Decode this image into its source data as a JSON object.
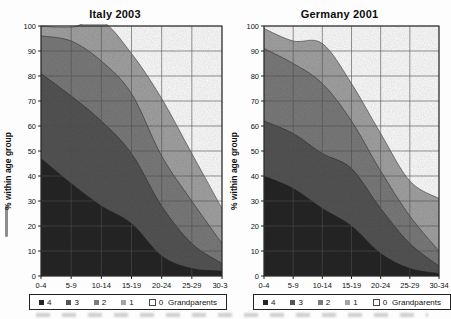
{
  "figure": {
    "y_axis_title": "% within age group",
    "y_ticks": [
      "100",
      "90",
      "80",
      "70",
      "60",
      "50",
      "40",
      "30",
      "20",
      "10",
      "0"
    ],
    "x_categories": [
      "0-4",
      "5-9",
      "10-14",
      "15-19",
      "20-24",
      "25-29",
      "30-34"
    ],
    "legend": {
      "labels": [
        "4",
        "3",
        "2",
        "1",
        "0"
      ],
      "suffix": "Grandparents"
    },
    "colors": {
      "band_4": "#262626",
      "band_3": "#555555",
      "band_2": "#7c7c7c",
      "band_1": "#a4a4a4",
      "band_0": "#ffffff",
      "gridline": "#555555",
      "plot_border": "#222222"
    }
  },
  "chart_data": [
    {
      "type": "area",
      "stacked": true,
      "title": "Italy 2003",
      "categories": [
        "0-4",
        "5-9",
        "10-14",
        "15-19",
        "20-24",
        "25-29",
        "30-34"
      ],
      "series": [
        {
          "name": "4",
          "color": "#262626",
          "values": [
            47,
            37,
            28,
            21,
            8,
            3,
            2
          ]
        },
        {
          "name": "3",
          "color": "#555555",
          "values": [
            34,
            35,
            34,
            28,
            20,
            10,
            3
          ]
        },
        {
          "name": "2",
          "color": "#7c7c7c",
          "values": [
            15,
            22,
            24,
            24,
            20,
            17,
            8
          ]
        },
        {
          "name": "1",
          "color": "#a4a4a4",
          "values": [
            4,
            5.5,
            16,
            16,
            23,
            19,
            14
          ]
        },
        {
          "name": "0 Grandparents",
          "color": "#ffffff",
          "values": [
            0,
            0.5,
            -2,
            11,
            29,
            51,
            73
          ]
        }
      ],
      "xlabel": "",
      "ylabel": "% within age group",
      "ylim": [
        0,
        100
      ],
      "grid": true,
      "legend_position": "bottom"
    },
    {
      "type": "area",
      "stacked": true,
      "title": "Germany 2001",
      "categories": [
        "0-4",
        "5-9",
        "10-14",
        "15-19",
        "20-24",
        "25-29",
        "30-34"
      ],
      "series": [
        {
          "name": "4",
          "color": "#262626",
          "values": [
            40,
            35,
            27,
            20,
            9,
            3,
            1
          ]
        },
        {
          "name": "3",
          "color": "#555555",
          "values": [
            22,
            22,
            22,
            23,
            18,
            10,
            3
          ]
        },
        {
          "name": "2",
          "color": "#7c7c7c",
          "values": [
            29,
            28,
            28,
            19,
            15,
            11,
            6
          ]
        },
        {
          "name": "1",
          "color": "#a4a4a4",
          "values": [
            8,
            9,
            16,
            15,
            15,
            14,
            21
          ]
        },
        {
          "name": "0 Grandparents",
          "color": "#ffffff",
          "values": [
            1,
            6,
            7,
            23,
            43,
            62,
            69
          ]
        }
      ],
      "xlabel": "",
      "ylabel": "% within age group",
      "ylim": [
        0,
        100
      ],
      "grid": true,
      "legend_position": "bottom"
    }
  ]
}
